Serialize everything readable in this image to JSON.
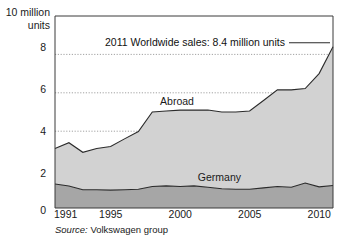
{
  "chart_data": {
    "type": "area",
    "stacked": true,
    "title": "",
    "subtitle": "",
    "xlabel": "",
    "ylabel": "10 million units",
    "yaxis_title_lines": [
      "10 million",
      "units"
    ],
    "ylim": [
      0,
      10
    ],
    "xlim": [
      1991,
      2011
    ],
    "yticks": [
      0,
      2,
      4,
      6,
      8
    ],
    "ytick_labels": [
      "0",
      "2",
      "4",
      "6",
      "8"
    ],
    "xticks": [
      1991,
      1995,
      2000,
      2005,
      2010
    ],
    "xtick_labels": [
      "1991",
      "1995",
      "2000",
      "2005",
      "2010"
    ],
    "grid": "horizontal-dotted",
    "legend": "inline-area-labels",
    "x": [
      1991,
      1992,
      1993,
      1994,
      1995,
      1996,
      1997,
      1998,
      1999,
      2000,
      2001,
      2002,
      2003,
      2004,
      2005,
      2006,
      2007,
      2008,
      2009,
      2010,
      2011
    ],
    "series": [
      {
        "name": "Germany",
        "color": "#a6a6a6",
        "values": [
          1.25,
          1.15,
          0.95,
          0.95,
          0.93,
          0.95,
          0.98,
          1.12,
          1.15,
          1.12,
          1.15,
          1.08,
          1.0,
          0.98,
          0.98,
          1.05,
          1.12,
          1.08,
          1.3,
          1.1,
          1.17
        ]
      },
      {
        "name": "Abroad",
        "color": "#d2d2d2",
        "values": [
          1.85,
          2.25,
          1.95,
          2.15,
          2.27,
          2.65,
          3.0,
          3.88,
          3.9,
          3.98,
          3.95,
          4.02,
          4.0,
          4.02,
          4.07,
          4.55,
          5.03,
          5.07,
          4.92,
          5.9,
          7.23
        ]
      }
    ],
    "totals": [
      3.1,
      3.4,
      2.9,
      3.1,
      3.2,
      3.6,
      3.98,
      5.0,
      5.05,
      5.1,
      5.1,
      5.1,
      5.0,
      5.0,
      5.05,
      5.6,
      6.15,
      6.15,
      6.22,
      7.0,
      8.4
    ],
    "series_labels": [
      {
        "text": "Abroad",
        "x": 2000,
        "y": 5.55
      },
      {
        "text": "Germany",
        "x": 2003,
        "y": 1.62
      }
    ],
    "annotations": [
      {
        "text": "2011 Worldwide sales: 8.4 million units",
        "leader": true,
        "target_x": 2011,
        "target_y": 8.4
      }
    ],
    "source": {
      "lead": "Source:",
      "text": " Volkswagen group"
    }
  }
}
